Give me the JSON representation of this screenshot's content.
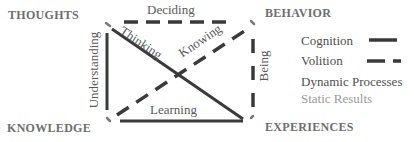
{
  "diagram": {
    "corners": {
      "top_left": "THOUGHTS",
      "top_right": "BEHAVIOR",
      "bottom_left": "KNOWLEDGE",
      "bottom_right": "EXPERIENCES"
    },
    "edges": [
      {
        "id": "top",
        "label": "Deciding",
        "from": "THOUGHTS",
        "to": "BEHAVIOR",
        "kind": "volition"
      },
      {
        "id": "left",
        "label": "Understanding",
        "from": "KNOWLEDGE",
        "to": "THOUGHTS",
        "kind": "cognition"
      },
      {
        "id": "right",
        "label": "Being",
        "from": "BEHAVIOR",
        "to": "EXPERIENCES",
        "kind": "volition"
      },
      {
        "id": "bottom",
        "label": "Learning",
        "from": "KNOWLEDGE",
        "to": "EXPERIENCES",
        "kind": "cognition"
      },
      {
        "id": "diag_tl_br",
        "label": "Thinking",
        "from": "THOUGHTS",
        "to": "EXPERIENCES",
        "kind": "cognition"
      },
      {
        "id": "diag_bl_tr",
        "label": "Knowing",
        "from": "KNOWLEDGE",
        "to": "BEHAVIOR",
        "kind": "volition"
      }
    ],
    "legend": {
      "cognition": "Cognition",
      "volition": "Volition",
      "dynamic": "Dynamic Processes",
      "static": "Static Results"
    },
    "colors": {
      "line": "#3a3a3a",
      "corner_text": "#6e6e6e",
      "static_text": "#9a9a9a",
      "dot": "#7a7a7a"
    }
  }
}
